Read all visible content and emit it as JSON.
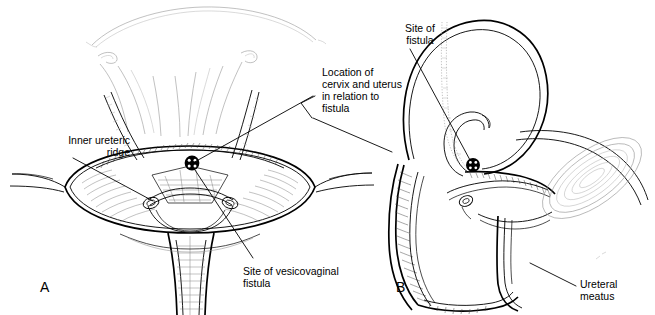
{
  "figure": {
    "background_color": "#ffffff",
    "ink_color": "#000000",
    "width": 655,
    "height": 315,
    "style": "line-art medical illustration, two panels"
  },
  "panels": [
    {
      "id": "A",
      "label": "A",
      "view": "anterior / open bladder interior with uterus superimposed"
    },
    {
      "id": "B",
      "label": "B",
      "view": "sagittal section of pelvis"
    }
  ],
  "labels": {
    "inner_ureteric_ridge": {
      "text": "Inner ureteric\nridge",
      "lines": [
        "Inner ureteric",
        "ridge"
      ],
      "align": "right",
      "panel": "A"
    },
    "location_cervix_uterus": {
      "text": "Location of\ncervix and uterus\nin relation to\nfistula",
      "lines": [
        "Location of",
        "cervix and uterus",
        "in relation to",
        "fistula"
      ],
      "align": "left",
      "panel": "A+B"
    },
    "site_of_vesicovaginal_fistula": {
      "text": "Site of vesicovaginal\nfistula",
      "lines": [
        "Site of vesicovaginal",
        "fistula"
      ],
      "align": "left",
      "panel": "A"
    },
    "site_of_fistula": {
      "text": "Site of\nfistula",
      "lines": [
        "Site of",
        "fistula"
      ],
      "align": "center",
      "panel": "B"
    },
    "ureteral_meatus": {
      "text": "Ureteral\nmeatus",
      "lines": [
        "Ureteral",
        "meatus"
      ],
      "align": "left",
      "panel": "B"
    }
  },
  "markers": {
    "fistula_marker_a": {
      "name": "fistula-site-marker",
      "shape": "filled-circle-with-dots",
      "x": 192,
      "y": 163
    },
    "fistula_marker_b": {
      "name": "fistula-site-marker",
      "shape": "filled-circle-with-dots",
      "x": 473,
      "y": 165
    }
  }
}
